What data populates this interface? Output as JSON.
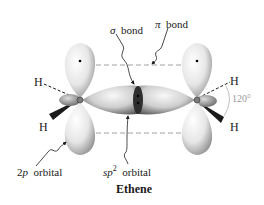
{
  "figure": {
    "title": "Ethene",
    "labels": {
      "sigma_bond": {
        "symbol": "σ",
        "text": "bond"
      },
      "pi_bond": {
        "symbol": "π",
        "text": "bond"
      },
      "p_orbital": {
        "prefix": "2",
        "italic": "p",
        "text": "orbital"
      },
      "sp2_orbital": {
        "italic": "sp",
        "sup": "2",
        "text": "orbital"
      },
      "angle": "120°",
      "h_left_top": "H",
      "h_left_bottom": "H",
      "h_right_top": "H",
      "h_right_bottom": "H"
    },
    "atoms": {
      "carbons": [
        "C",
        "C"
      ],
      "hydrogens": [
        "H",
        "H",
        "H",
        "H"
      ]
    },
    "colors": {
      "orbital_light": "#f4f4f4",
      "orbital_dark": "#8c8c8c",
      "sigma_dark": "#3a3a3a",
      "dashed_line": "#a0a0a0",
      "wedge": "#1a1a1a",
      "text": "#1a1a1a",
      "angle_text": "#9a9a9a"
    }
  }
}
